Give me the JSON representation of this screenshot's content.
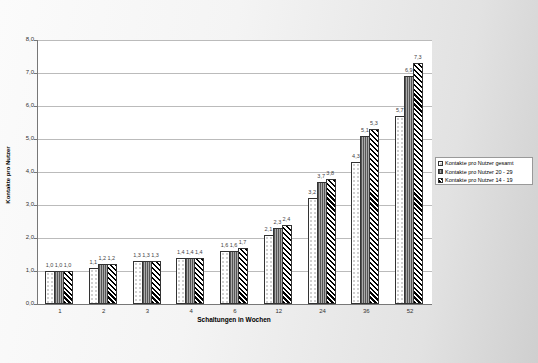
{
  "chart_data": {
    "type": "bar",
    "title": "",
    "xlabel": "Schaltungen in Wochen",
    "ylabel": "Kontakte pro Nutzer",
    "ylim": [
      0,
      8
    ],
    "yticks": [
      "0,0",
      "1,0",
      "2,0",
      "3,0",
      "4,0",
      "5,0",
      "6,0",
      "7,0",
      "8,0"
    ],
    "grid": true,
    "legend_position": "right",
    "categories": [
      "1",
      "2",
      "3",
      "4",
      "6",
      "12",
      "24",
      "36",
      "52"
    ],
    "series": [
      {
        "name": "Kontakte pro Nutzer gesamt",
        "values": [
          1.0,
          1.1,
          1.3,
          1.4,
          1.6,
          2.1,
          3.2,
          4.3,
          5.7
        ],
        "labels": [
          "1,0",
          "1,1",
          "1,3",
          "1,4",
          "1,6",
          "2,1",
          "3,2",
          "4,3",
          "5,7"
        ]
      },
      {
        "name": "Kontakte pro Nutzer 20 - 29",
        "values": [
          1.0,
          1.2,
          1.3,
          1.4,
          1.6,
          2.3,
          3.7,
          5.1,
          6.9
        ],
        "labels": [
          "1,0",
          "1,2",
          "1,3",
          "1,4",
          "1,6",
          "2,3",
          "3,7",
          "5,1",
          "6,9"
        ]
      },
      {
        "name": "Kontakte pro Nutzer 14 - 19",
        "values": [
          1.0,
          1.2,
          1.3,
          1.4,
          1.7,
          2.4,
          3.8,
          5.3,
          7.3
        ],
        "labels": [
          "1,0",
          "1,2",
          "1,3",
          "1,4",
          "1,7",
          "2,4",
          "3,8",
          "5,3",
          "7,3"
        ]
      }
    ]
  },
  "axis": {
    "xlabel": "Schaltungen in Wochen",
    "ylabel": "Kontakte pro Nutzer"
  },
  "legend": [
    "Kontakte pro Nutzer gesamt",
    "Kontakte pro Nutzer 20 - 29",
    "Kontakte pro Nutzer 14 - 19"
  ]
}
